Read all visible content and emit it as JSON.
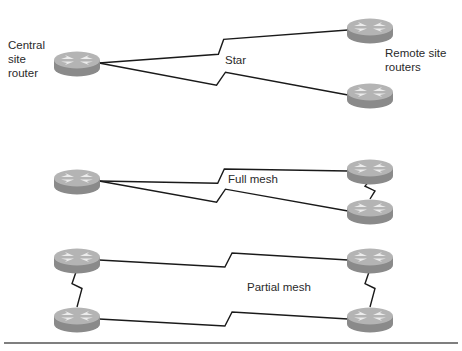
{
  "labels": {
    "central": [
      "Central",
      "site",
      "router"
    ],
    "remote": [
      "Remote site",
      "routers"
    ],
    "star": "Star",
    "full_mesh": "Full mesh",
    "partial_mesh": "Partial mesh"
  },
  "colors": {
    "router_top": "#b4b4b4",
    "router_side": "#8a8a8a",
    "router_arrows": "#ececec",
    "link": "#1a1a1a",
    "rule": "#555555"
  },
  "topologies": [
    {
      "name": "star",
      "routers": [
        "central",
        "remote-top",
        "remote-bottom"
      ],
      "links": [
        [
          "central",
          "remote-top",
          "serial"
        ],
        [
          "central",
          "remote-bottom",
          "serial"
        ]
      ]
    },
    {
      "name": "full-mesh",
      "routers": [
        "left",
        "right-top",
        "right-bottom"
      ],
      "links": [
        [
          "left",
          "right-top",
          "serial"
        ],
        [
          "left",
          "right-bottom",
          "serial"
        ],
        [
          "right-top",
          "right-bottom",
          "serial"
        ]
      ]
    },
    {
      "name": "partial-mesh",
      "routers": [
        "left-top",
        "left-bottom",
        "right-top",
        "right-bottom"
      ],
      "links": [
        [
          "left-top",
          "right-top",
          "serial"
        ],
        [
          "left-bottom",
          "right-bottom",
          "serial"
        ],
        [
          "left-top",
          "left-bottom",
          "serial"
        ],
        [
          "right-top",
          "right-bottom",
          "serial"
        ]
      ]
    }
  ]
}
